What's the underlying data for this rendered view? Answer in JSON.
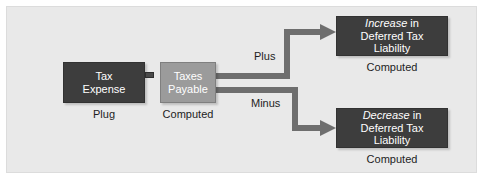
{
  "diagram": {
    "title_colors": {
      "background": "#e9e9e9",
      "dark_box": "#3d3d3d",
      "gray_box": "#9b9b9b",
      "arrow": "#6e6e6e",
      "text_on_box": "#ffffff",
      "caption_text": "#1d1d1d"
    },
    "nodes": {
      "tax_expense": {
        "line1": "Tax",
        "line2": "Expense",
        "caption": "Plug"
      },
      "taxes_payable": {
        "line1": "Taxes",
        "line2": "Payable",
        "caption": "Computed"
      },
      "increase_dtl": {
        "emphasis": "Increase",
        "line1_rest": " in",
        "line2": "Deferred Tax Liability",
        "caption": "Computed"
      },
      "decrease_dtl": {
        "emphasis": "Decrease",
        "line1_rest": " in",
        "line2": "Deferred Tax Liability",
        "caption": "Computed"
      }
    },
    "operators": {
      "equals": "="
    },
    "branch_labels": {
      "plus": "Plus",
      "minus": "Minus"
    }
  }
}
